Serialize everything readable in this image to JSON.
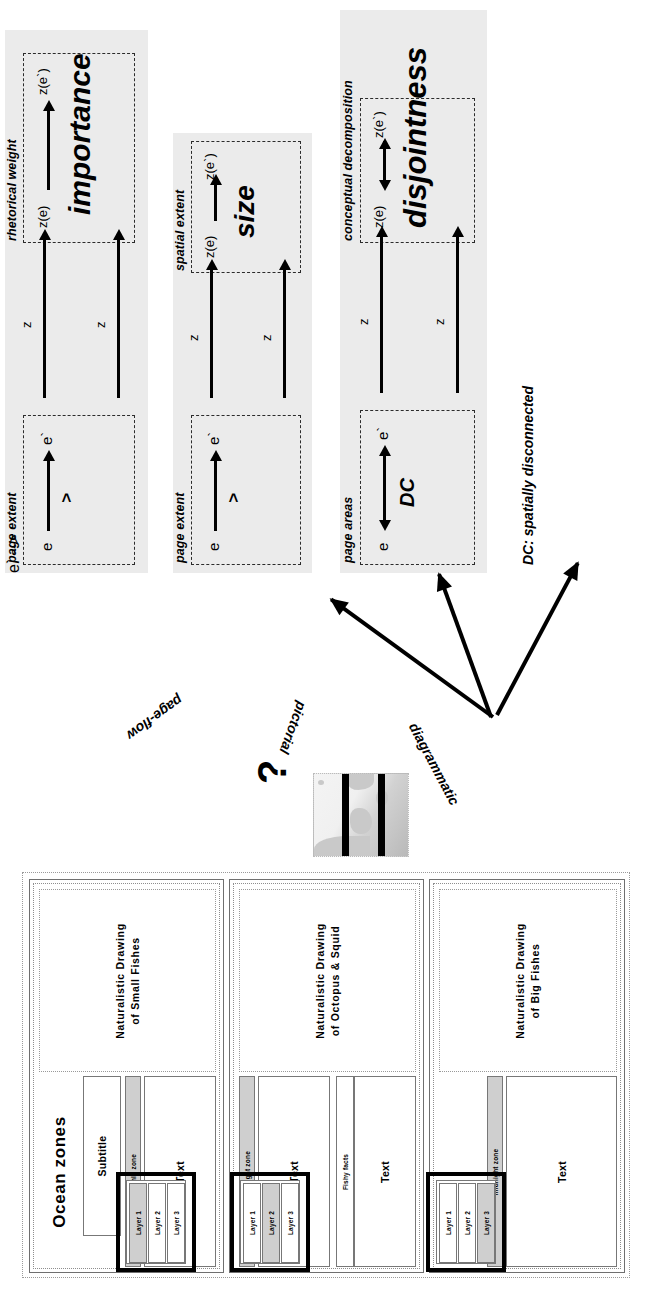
{
  "figure": {
    "caption_note": "DC: spatially disconnected",
    "question_mark": "?"
  },
  "mapping_arrows": [
    {
      "label": "page-flow",
      "target": "panel-importance"
    },
    {
      "label": "pictorial",
      "target": "panel-size"
    },
    {
      "label": "diagrammatic",
      "target": "panel-disjointness"
    }
  ],
  "panels": [
    {
      "id": "importance",
      "source_label": "page extent",
      "target_label": "rhetorical weight",
      "relation_name": "importance",
      "source_relation": ">",
      "source_nodes": [
        "e",
        "e`"
      ],
      "target_nodes": [
        "z(e)",
        "z(e`)"
      ],
      "map_label": "z",
      "bidirectional": false
    },
    {
      "id": "size",
      "source_label": "page extent",
      "target_label": "spatial extent",
      "relation_name": "size",
      "source_relation": ">",
      "source_nodes": [
        "e",
        "e`"
      ],
      "target_nodes": [
        "z(e)",
        "z(e`)"
      ],
      "map_label": "z",
      "bidirectional": false
    },
    {
      "id": "disjointness",
      "source_label": "page areas",
      "target_label": "conceptual decomposition",
      "relation_name": "disjointness",
      "source_relation": "DC",
      "source_nodes": [
        "e",
        "e`"
      ],
      "target_nodes": [
        "z(e)",
        "z(e`)"
      ],
      "map_label": "z",
      "bidirectional": true
    }
  ],
  "deck": {
    "title": "Ocean zones",
    "subtitle": "Subtitle",
    "slides": [
      {
        "zone": "sunlit zone",
        "picture_caption": "Naturalistic Drawing\nof Small Fishes",
        "body_label": "Text",
        "extra_label": "",
        "layers": [
          "Layer 1",
          "Layer 2",
          "Layer 3"
        ],
        "active_layer": "Layer 1",
        "highlighted": true
      },
      {
        "zone": "twilight zone",
        "picture_caption": "Naturalistic Drawing\nof Octopus & Squid",
        "body_label": "Text",
        "extra_label": "Fishy facts",
        "layers": [
          "Layer 1",
          "Layer 2",
          "Layer 3"
        ],
        "active_layer": "Layer 2",
        "highlighted": true
      },
      {
        "zone": "midnight zone",
        "picture_caption": "Naturalistic Drawing\nof Big Fishes",
        "body_label": "Text",
        "extra_label": "",
        "layers": [
          "Layer 1",
          "Layer 2",
          "Layer 3"
        ],
        "active_layer": "Layer 3",
        "highlighted": true
      }
    ]
  },
  "colors": {
    "panel_bg": "#ebebeb",
    "shade": "#cfcfcf",
    "ink": "#000000"
  }
}
